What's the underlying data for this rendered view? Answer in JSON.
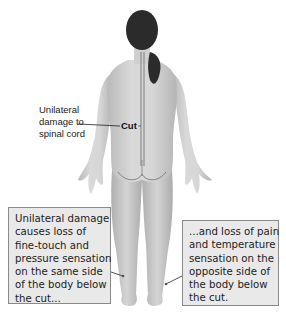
{
  "figure": {
    "colors": {
      "skin": "#d2d2d2",
      "skin_shadow": "#a9a9a9",
      "hair": "#2b2b2b",
      "spinal_cord": "#8c8c8c",
      "box_fill": "#e9e9e9",
      "box_border": "#8a8a8a"
    }
  },
  "labels": {
    "side_label": [
      "Unilateral",
      "damage to",
      "spinal cord"
    ],
    "cut": "Cut"
  },
  "callouts": {
    "left": [
      "Unilateral damage",
      "causes loss of",
      "fine-touch and",
      "pressure sensation",
      "on the same side",
      "of the body below",
      "the cut..."
    ],
    "right": [
      "...and loss of pain",
      "and temperature",
      "sensation on the",
      "opposite side of",
      "the body below",
      "the cut."
    ]
  }
}
